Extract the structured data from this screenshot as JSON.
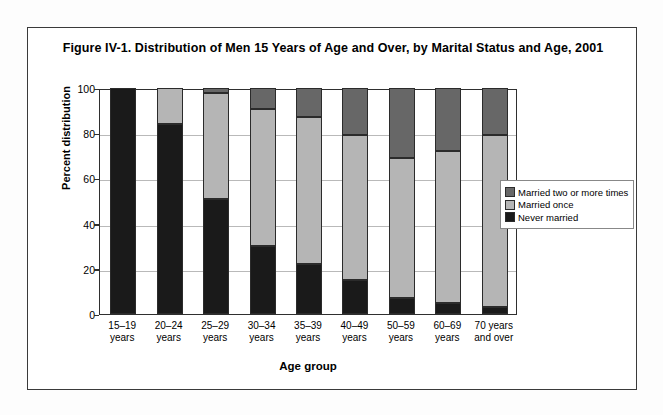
{
  "figure": {
    "title": "Figure IV-1. Distribution of Men 15 Years of Age and Over, by Marital Status and Age, 2001"
  },
  "chart_data": {
    "type": "bar",
    "subtype": "stacked-percent",
    "title": "Figure IV-1. Distribution of Men 15 Years of Age and Over, by Marital Status and Age, 2001",
    "xlabel": "Age group",
    "ylabel": "Percent distribution",
    "ylim": [
      0,
      100
    ],
    "yticks": [
      0,
      20,
      40,
      60,
      80,
      100
    ],
    "grid": true,
    "legend_position": "right",
    "categories": [
      "15–19 years",
      "20–24 years",
      "25–29 years",
      "30–34 years",
      "35–39 years",
      "40–49 years",
      "50–59 years",
      "60–69 years",
      "70 years and over"
    ],
    "series": [
      {
        "name": "Never married",
        "color": "#1a1a1a",
        "values": [
          100,
          84,
          51,
          30,
          22,
          15,
          7,
          5,
          3
        ]
      },
      {
        "name": "Married once",
        "color": "#b5b5b5",
        "values": [
          0,
          16,
          47,
          60.5,
          65,
          64,
          62,
          67,
          76
        ]
      },
      {
        "name": "Married two or more times",
        "color": "#676767",
        "values": [
          0,
          0,
          2,
          9.5,
          13,
          21,
          31,
          28,
          21
        ]
      }
    ],
    "cumulative_tops": {
      "never_married": [
        100,
        84,
        51,
        30,
        22,
        15,
        7,
        5,
        3
      ],
      "married_once": [
        100,
        100,
        98,
        90.5,
        87,
        79,
        69,
        72,
        79
      ],
      "married_two_or_more": [
        100,
        100,
        100,
        100,
        100,
        100,
        100,
        100,
        100
      ]
    }
  },
  "axes": {
    "y_tick_labels": [
      "100",
      "80",
      "60",
      "40",
      "20",
      "0"
    ],
    "y_title": "Percent distribution",
    "x_title": "Age group",
    "x_tick_labels": [
      [
        "15–19",
        "years"
      ],
      [
        "20–24",
        "years"
      ],
      [
        "25–29",
        "years"
      ],
      [
        "30–34",
        "years"
      ],
      [
        "35–39",
        "years"
      ],
      [
        "40–49",
        "years"
      ],
      [
        "50–59",
        "years"
      ],
      [
        "60–69",
        "years"
      ],
      [
        "70 years",
        "and over"
      ]
    ]
  },
  "legend": {
    "items": [
      {
        "label": "Married two or more times",
        "color": "#676767"
      },
      {
        "label": "Married once",
        "color": "#b5b5b5"
      },
      {
        "label": "Never married",
        "color": "#1a1a1a"
      }
    ]
  },
  "colors": {
    "never_married": "#1a1a1a",
    "married_once": "#b5b5b5",
    "married_two_or_more": "#676767",
    "frame": "#3a3a3a",
    "gridline": "#b9b9b9",
    "background": "#ffffff"
  }
}
